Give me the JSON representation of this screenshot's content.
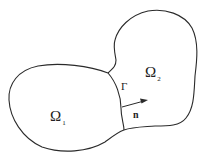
{
  "diagram": {
    "type": "domain-decomposition",
    "regions": [
      {
        "symbol": "Ω",
        "subscript": "1",
        "name": "omega-1"
      },
      {
        "symbol": "Ω",
        "subscript": "2",
        "name": "omega-2"
      }
    ],
    "interface": {
      "symbol": "Γ"
    },
    "normal": {
      "symbol": "n"
    },
    "stroke_color": "#2a2a2a",
    "background": "#ffffff"
  }
}
